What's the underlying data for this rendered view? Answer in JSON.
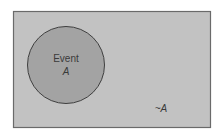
{
  "diagram": {
    "type": "venn",
    "universe": {
      "label": "~A",
      "fill": "#c2c2c2",
      "stroke": "#6a6a6a"
    },
    "event": {
      "label_line1": "Event",
      "label_line2": "A",
      "fill": "#a3a3a3",
      "stroke": "#3f3f3f"
    },
    "text_color": "#3a3a3a"
  }
}
